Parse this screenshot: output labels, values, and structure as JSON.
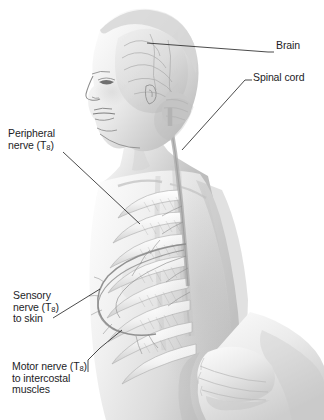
{
  "figure": {
    "background_color": "#ffffff",
    "text_color": "#1d1d1f",
    "leader_color": "#2b2b2b",
    "width": 324,
    "height": 420
  },
  "labels": {
    "brain": {
      "text": "Brain",
      "side": "right"
    },
    "spinal_cord": {
      "text": "Spinal cord",
      "side": "right"
    },
    "peripheral_nerve": {
      "line1": "Peripheral",
      "line2_prefix": "nerve (T",
      "subscript": "8",
      "line2_suffix": ")",
      "side": "left"
    },
    "sensory_nerve": {
      "line1": "Sensory",
      "line2_prefix": "nerve (T",
      "subscript": "8",
      "line2_suffix": ")",
      "line3": "to skin",
      "side": "left"
    },
    "motor_nerve": {
      "line1_prefix": "Motor nerve (T",
      "subscript": "8",
      "line1_suffix": ")",
      "line2": "to intercostal",
      "line3": "muscles",
      "side": "left"
    }
  },
  "anatomy": {
    "subject": "adolescent figure, three-quarter left profile, bare torso",
    "structures": [
      "brain",
      "cerebellum",
      "spinal cord",
      "rib cage",
      "intercostal muscles",
      "peripheral nerve T8",
      "sensory branch to skin",
      "motor branch to intercostal muscles",
      "forearm and hand across abdomen"
    ],
    "rib_count_visible": 8,
    "style": "grayscale airbrushed medical illustration"
  }
}
